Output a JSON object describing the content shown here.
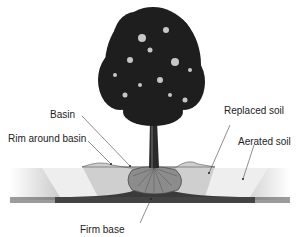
{
  "diagram": {
    "labels": {
      "basin": "Basin",
      "rim": "Rim around basin",
      "replaced_soil": "Replaced soil",
      "aerated_soil": "Aerated soil",
      "firm_base": "Firm base"
    }
  }
}
